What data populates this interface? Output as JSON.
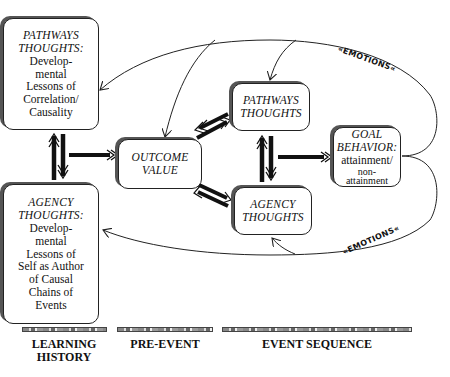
{
  "diagram": {
    "boxes": {
      "pathways_history": {
        "title_line1": "PATHWAYS",
        "title_line2": "THOUGHTS:",
        "body": [
          "Develop-",
          "mental",
          "Lessons of",
          "Correlation/",
          "Causality"
        ]
      },
      "agency_history": {
        "title_line1": "AGENCY",
        "title_line2": "THOUGHTS:",
        "body": [
          "Develop-",
          "mental",
          "Lessons of",
          "Self as Author",
          "of Causal",
          "Chains of",
          "Events"
        ]
      },
      "outcome_value": {
        "title_line1": "OUTCOME",
        "title_line2": "VALUE"
      },
      "pathways_thoughts": {
        "title_line1": "PATHWAYS",
        "title_line2": "THOUGHTS"
      },
      "agency_thoughts": {
        "title_line1": "AGENCY",
        "title_line2": "THOUGHTS"
      },
      "goal_behavior": {
        "title_line1": "GOAL",
        "title_line2": "BEHAVIOR:",
        "body": [
          "attainment/",
          "non-",
          "attainment"
        ]
      }
    },
    "feedback_labels": {
      "top": "«EMOTIONS«",
      "bottom": "«EMOTIONS«"
    },
    "phases": {
      "learning_history": [
        "LEARNING",
        "HISTORY"
      ],
      "pre_event": "PRE-EVENT",
      "event_sequence": "EVENT SEQUENCE"
    },
    "colors": {
      "line": "#222222",
      "shadow": "#555555",
      "background": "#ffffff"
    }
  }
}
